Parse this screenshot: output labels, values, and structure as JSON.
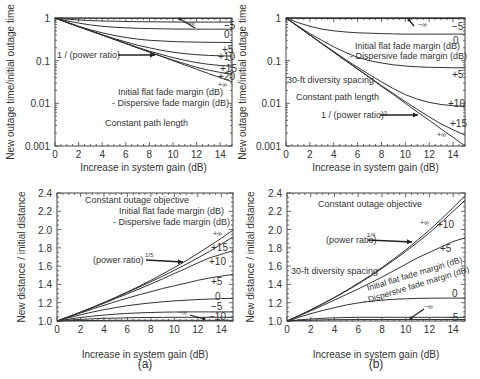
{
  "figure": {
    "caption_a": "(a)",
    "caption_b": "(b)"
  },
  "chart_data": [
    {
      "id": "a-top",
      "type": "line",
      "title": "",
      "xlabel": "Increase in system gain (dB)",
      "ylabel": "New outage time/initial outage time",
      "xlim": [
        0,
        15
      ],
      "ylim": [
        0.001,
        1
      ],
      "yscale": "log",
      "xticks": [
        0,
        2,
        4,
        6,
        8,
        10,
        12,
        14
      ],
      "yticks": [
        1,
        0.1,
        0.01,
        0.001
      ],
      "ytick_labels": [
        "1",
        "0.1",
        "0.01",
        "0.001"
      ],
      "annotations": [
        "Initial flat fade margin (dB)",
        "- Dispersive fade margin (dB)",
        "Constant path length",
        "1 / (power ratio)"
      ],
      "arrow_label": "1 / (power ratio)",
      "x": [
        0,
        1,
        2,
        3,
        4,
        5,
        6,
        7,
        8,
        9,
        10,
        11,
        12,
        13,
        14,
        15
      ],
      "series": [
        {
          "name": "−∞",
          "values": [
            1,
            0.995,
            0.99,
            0.988,
            0.986,
            0.985,
            0.984,
            0.983,
            0.982,
            0.981,
            0.98,
            0.98,
            0.98,
            0.98,
            0.98,
            0.98
          ]
        },
        {
          "name": "−5",
          "values": [
            1,
            0.94,
            0.9,
            0.87,
            0.85,
            0.84,
            0.83,
            0.82,
            0.815,
            0.81,
            0.806,
            0.803,
            0.8,
            0.8,
            0.8,
            0.8
          ]
        },
        {
          "name": "0",
          "values": [
            1,
            0.86,
            0.76,
            0.69,
            0.64,
            0.61,
            0.59,
            0.575,
            0.565,
            0.558,
            0.553,
            0.55,
            0.548,
            0.547,
            0.546,
            0.545
          ]
        },
        {
          "name": "+5",
          "values": [
            1,
            0.8,
            0.64,
            0.53,
            0.45,
            0.39,
            0.35,
            0.32,
            0.3,
            0.29,
            0.28,
            0.275,
            0.272,
            0.27,
            0.268,
            0.267
          ]
        },
        {
          "name": "+10",
          "values": [
            1,
            0.79,
            0.63,
            0.5,
            0.405,
            0.33,
            0.275,
            0.23,
            0.2,
            0.175,
            0.158,
            0.146,
            0.138,
            0.133,
            0.13,
            0.128
          ]
        },
        {
          "name": "+15",
          "values": [
            1,
            0.79,
            0.63,
            0.5,
            0.4,
            0.32,
            0.255,
            0.205,
            0.168,
            0.14,
            0.118,
            0.102,
            0.09,
            0.082,
            0.077,
            0.074
          ]
        },
        {
          "name": "+20",
          "values": [
            1,
            0.79,
            0.63,
            0.5,
            0.4,
            0.317,
            0.252,
            0.2,
            0.16,
            0.128,
            0.103,
            0.085,
            0.07,
            0.06,
            0.053,
            0.048
          ]
        },
        {
          "name": "+∞",
          "values": [
            1,
            0.794,
            0.631,
            0.501,
            0.398,
            0.316,
            0.251,
            0.2,
            0.158,
            0.126,
            0.1,
            0.079,
            0.063,
            0.05,
            0.04,
            0.032
          ]
        }
      ]
    },
    {
      "id": "b-top",
      "type": "line",
      "title": "",
      "xlabel": "Increase in system gain (dB)",
      "ylabel": "New outage time/initial outage time",
      "xlim": [
        0,
        15
      ],
      "ylim": [
        0.001,
        1
      ],
      "yscale": "log",
      "xticks": [
        0,
        2,
        4,
        6,
        8,
        10,
        12,
        14
      ],
      "yticks": [
        1,
        0.1,
        0.01,
        0.001
      ],
      "ytick_labels": [
        "1",
        "0.1",
        "0.01",
        "0.001"
      ],
      "annotations": [
        "Initial flat fade margin (dB)",
        "- Dispersive fade margin (dB)",
        "30-ft diversity spacing",
        "Constant path length",
        "1 / (power ratio)²"
      ],
      "arrow_label": "1 / (power ratio)²",
      "x": [
        0,
        1,
        2,
        3,
        4,
        5,
        6,
        7,
        8,
        9,
        10,
        11,
        12,
        13,
        14,
        15
      ],
      "series": [
        {
          "name": "−∞",
          "values": [
            1,
            1,
            1,
            1,
            1,
            1,
            1,
            1,
            1,
            1,
            1,
            1,
            1,
            1,
            1,
            1
          ]
        },
        {
          "name": "−5",
          "values": [
            1,
            0.99,
            0.98,
            0.975,
            0.97,
            0.97,
            0.97,
            0.97,
            0.97,
            0.97,
            0.97,
            0.97,
            0.97,
            0.97,
            0.97,
            0.97
          ]
        },
        {
          "name": "0",
          "values": [
            1,
            0.78,
            0.64,
            0.55,
            0.5,
            0.47,
            0.45,
            0.44,
            0.43,
            0.425,
            0.42,
            0.42,
            0.42,
            0.42,
            0.42,
            0.42
          ]
        },
        {
          "name": "+5",
          "values": [
            1,
            0.65,
            0.43,
            0.3,
            0.21,
            0.155,
            0.12,
            0.1,
            0.088,
            0.08,
            0.075,
            0.072,
            0.07,
            0.069,
            0.068,
            0.068
          ]
        },
        {
          "name": "+10",
          "values": [
            1,
            0.64,
            0.4,
            0.255,
            0.165,
            0.106,
            0.07,
            0.047,
            0.032,
            0.022,
            0.016,
            0.0125,
            0.0105,
            0.0094,
            0.0088,
            0.0085
          ]
        },
        {
          "name": "+15",
          "values": [
            1,
            0.63,
            0.4,
            0.25,
            0.159,
            0.1,
            0.064,
            0.041,
            0.026,
            0.017,
            0.011,
            0.0072,
            0.0048,
            0.0033,
            0.0024,
            0.0018
          ]
        },
        {
          "name": "+∞",
          "values": [
            1,
            0.631,
            0.398,
            0.251,
            0.158,
            0.1,
            0.063,
            0.04,
            0.025,
            0.016,
            0.01,
            0.0063,
            0.004,
            0.0025,
            0.0016,
            0.001
          ]
        }
      ]
    },
    {
      "id": "a-bottom",
      "type": "line",
      "title": "",
      "xlabel": "Increase in system gain (dB)",
      "ylabel": "New distance / initial distance",
      "xlim": [
        0,
        15
      ],
      "ylim": [
        1.0,
        2.4
      ],
      "xticks": [
        0,
        2,
        4,
        6,
        8,
        10,
        12,
        14
      ],
      "yticks": [
        1.0,
        1.2,
        1.4,
        1.6,
        1.8,
        2.0,
        2.2,
        2.4
      ],
      "ytick_labels": [
        "1.0",
        "1.2",
        "1.4",
        "1.6",
        "1.8",
        "2.0",
        "2.2",
        "2.4"
      ],
      "annotations": [
        "Constant outage objective",
        "Initial flat fade margin (dB)",
        "- Dispersive fade margin (dB)",
        "(power ratio)1/5"
      ],
      "arrow_label": "(power ratio)",
      "arrow_label_sup": "1/5",
      "x": [
        0,
        1,
        2,
        3,
        4,
        5,
        6,
        7,
        8,
        9,
        10,
        11,
        12,
        13,
        14,
        15
      ],
      "series": [
        {
          "name": "+∞",
          "values": [
            1,
            1.047,
            1.096,
            1.148,
            1.202,
            1.259,
            1.318,
            1.38,
            1.445,
            1.514,
            1.585,
            1.66,
            1.738,
            1.82,
            1.905,
            1.995
          ]
        },
        {
          "name": "+15",
          "values": [
            1,
            1.047,
            1.096,
            1.147,
            1.2,
            1.255,
            1.312,
            1.37,
            1.43,
            1.49,
            1.555,
            1.62,
            1.69,
            1.76,
            1.84,
            1.92
          ]
        },
        {
          "name": "+10",
          "values": [
            1,
            1.046,
            1.094,
            1.143,
            1.194,
            1.246,
            1.298,
            1.35,
            1.405,
            1.46,
            1.52,
            1.575,
            1.635,
            1.69,
            1.73,
            1.77
          ]
        },
        {
          "name": "+5",
          "values": [
            1,
            1.044,
            1.088,
            1.13,
            1.172,
            1.212,
            1.25,
            1.287,
            1.32,
            1.355,
            1.385,
            1.415,
            1.445,
            1.47,
            1.49,
            1.51
          ]
        },
        {
          "name": "0",
          "values": [
            1,
            1.035,
            1.068,
            1.097,
            1.124,
            1.147,
            1.167,
            1.184,
            1.198,
            1.21,
            1.22,
            1.228,
            1.235,
            1.24,
            1.245,
            1.248
          ]
        },
        {
          "name": "−5",
          "values": [
            1,
            1.02,
            1.038,
            1.053,
            1.065,
            1.075,
            1.083,
            1.089,
            1.093,
            1.096,
            1.098,
            1.099,
            1.1,
            1.1,
            1.1,
            1.1
          ]
        },
        {
          "name": "−10",
          "values": [
            1,
            1.01,
            1.018,
            1.024,
            1.029,
            1.032,
            1.035,
            1.037,
            1.038,
            1.039,
            1.04,
            1.04,
            1.04,
            1.04,
            1.04,
            1.04
          ]
        },
        {
          "name": "−∞",
          "values": [
            1,
            1.003,
            1.005,
            1.006,
            1.007,
            1.008,
            1.008,
            1.008,
            1.008,
            1.008,
            1.008,
            1.008,
            1.008,
            1.008,
            1.008,
            1.008
          ]
        }
      ]
    },
    {
      "id": "b-bottom",
      "type": "line",
      "title": "",
      "xlabel": "Increase in system gain (dB)",
      "ylabel": "New distance / initial distance",
      "xlim": [
        0,
        15
      ],
      "ylim": [
        1.0,
        2.4
      ],
      "xticks": [
        0,
        2,
        4,
        6,
        8,
        10,
        12,
        14
      ],
      "yticks": [
        1.0,
        1.2,
        1.4,
        1.6,
        1.8,
        2.0,
        2.2,
        2.4
      ],
      "ytick_labels": [
        "1.0",
        "1.2",
        "1.4",
        "1.6",
        "1.8",
        "2.0",
        "2.2",
        "2.4"
      ],
      "annotations": [
        "Constant outage objective",
        "30-ft diversity spacing",
        "Initial flat fade margin (dB)",
        "- Dispersive fade margin (dB)",
        "(power ratio)1/4"
      ],
      "arrow_label": "(power ratio)",
      "arrow_label_sup": "1/4",
      "x": [
        0,
        1,
        2,
        3,
        4,
        5,
        6,
        7,
        8,
        9,
        10,
        11,
        12,
        13,
        14,
        15
      ],
      "series": [
        {
          "name": "+∞",
          "values": [
            1,
            1.059,
            1.122,
            1.189,
            1.259,
            1.334,
            1.413,
            1.496,
            1.585,
            1.679,
            1.778,
            1.884,
            1.995,
            2.113,
            2.239,
            2.371
          ]
        },
        {
          "name": "+10",
          "values": [
            1,
            1.058,
            1.12,
            1.186,
            1.255,
            1.328,
            1.405,
            1.487,
            1.574,
            1.665,
            1.76,
            1.86,
            1.965,
            2.08,
            2.2,
            2.32
          ]
        },
        {
          "name": "+5",
          "values": [
            1,
            1.055,
            1.112,
            1.17,
            1.23,
            1.29,
            1.35,
            1.415,
            1.48,
            1.55,
            1.62,
            1.69,
            1.75,
            1.81,
            1.87,
            1.91
          ]
        },
        {
          "name": "0",
          "values": [
            1,
            1.04,
            1.08,
            1.115,
            1.147,
            1.175,
            1.198,
            1.215,
            1.228,
            1.237,
            1.243,
            1.247,
            1.249,
            1.25,
            1.25,
            1.25
          ]
        },
        {
          "name": "−5",
          "values": [
            1,
            1.012,
            1.022,
            1.03,
            1.035,
            1.038,
            1.04,
            1.04,
            1.04,
            1.04,
            1.04,
            1.04,
            1.04,
            1.04,
            1.04,
            1.04
          ]
        },
        {
          "name": "−∞",
          "values": [
            1,
            1.005,
            1.009,
            1.012,
            1.014,
            1.015,
            1.016,
            1.016,
            1.016,
            1.016,
            1.016,
            1.016,
            1.016,
            1.016,
            1.016,
            1.016
          ]
        }
      ]
    }
  ]
}
